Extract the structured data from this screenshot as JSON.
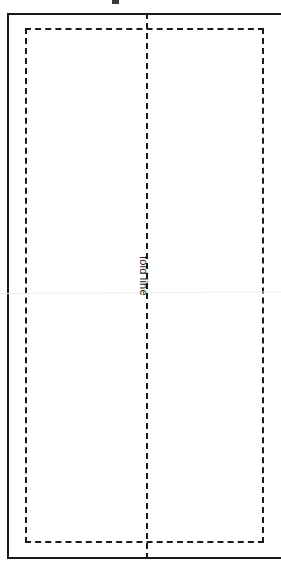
{
  "diagram": {
    "background_color": "#ffffff",
    "line_color": "#1a1a1a",
    "crease_color": "#ededed",
    "labels": {
      "fold_line": "fold line"
    },
    "elements": {
      "outer_frame_name": "sheet outline",
      "inner_dashed_name": "inner dashed boundary",
      "fold_line_name": "vertical fold line",
      "crease_name": "scan crease artifact",
      "artifact_name": "clipped edge mark"
    }
  }
}
